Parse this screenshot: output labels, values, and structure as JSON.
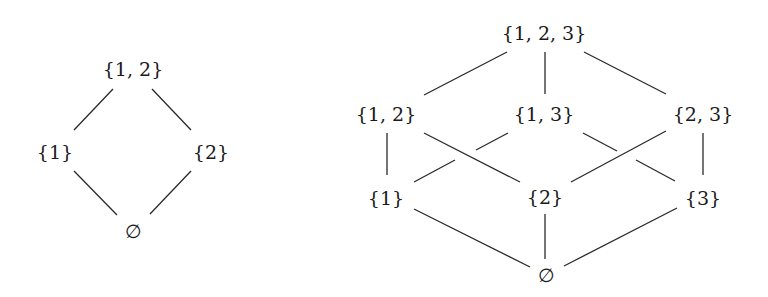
{
  "diagrams": [
    {
      "name": "hasse-diagram-powerset-2",
      "nodes": [
        {
          "id": "s12",
          "label": "{1, 2}",
          "x": 133,
          "y": 69
        },
        {
          "id": "s1",
          "label": "{1}",
          "x": 55,
          "y": 152
        },
        {
          "id": "s2",
          "label": "{2}",
          "x": 211,
          "y": 152
        },
        {
          "id": "empty",
          "label": "∅",
          "x": 133,
          "y": 231
        }
      ],
      "edges": [
        {
          "from": "s12",
          "to": "s1",
          "segments": [
            [
              113,
              89,
              74,
              130
            ]
          ]
        },
        {
          "from": "s12",
          "to": "s2",
          "segments": [
            [
              152,
              89,
              191,
              130
            ]
          ]
        },
        {
          "from": "s1",
          "to": "empty",
          "segments": [
            [
              74,
              171,
              117,
              215
            ]
          ]
        },
        {
          "from": "s2",
          "to": "empty",
          "segments": [
            [
              191,
              171,
              150,
              214
            ]
          ]
        }
      ]
    },
    {
      "name": "hasse-diagram-powerset-3",
      "nodes": [
        {
          "id": "s123",
          "label": "{1, 2, 3}",
          "x": 544,
          "y": 33
        },
        {
          "id": "s12",
          "label": "{1, 2}",
          "x": 386,
          "y": 114
        },
        {
          "id": "s13",
          "label": "{1, 3}",
          "x": 544,
          "y": 114
        },
        {
          "id": "s23",
          "label": "{2, 3}",
          "x": 703,
          "y": 114
        },
        {
          "id": "s1",
          "label": "{1}",
          "x": 386,
          "y": 198
        },
        {
          "id": "s2",
          "label": "{2}",
          "x": 545,
          "y": 197
        },
        {
          "id": "s3",
          "label": "{3}",
          "x": 703,
          "y": 198
        },
        {
          "id": "empty",
          "label": "∅",
          "x": 546,
          "y": 275
        }
      ],
      "edges": [
        {
          "from": "s123",
          "to": "s12",
          "segments": [
            [
              507,
              52,
              424,
              95
            ]
          ]
        },
        {
          "from": "s123",
          "to": "s13",
          "segments": [
            [
              545,
              52,
              545,
              94
            ]
          ]
        },
        {
          "from": "s123",
          "to": "s23",
          "segments": [
            [
              584,
              52,
              666,
              94
            ]
          ]
        },
        {
          "from": "s12",
          "to": "s1",
          "segments": [
            [
              387,
              133,
              387,
              175
            ]
          ]
        },
        {
          "from": "s12",
          "to": "s2",
          "segments": [
            [
              424,
              133,
              520,
              182
            ]
          ]
        },
        {
          "from": "s13",
          "to": "s1",
          "segments": [
            [
              508,
              133,
              476,
              150
            ],
            [
              455,
              160,
              414,
              182
            ]
          ]
        },
        {
          "from": "s13",
          "to": "s3",
          "segments": [
            [
              583,
              133,
              617,
              151
            ],
            [
              636,
              160,
              675,
              181
            ]
          ]
        },
        {
          "from": "s23",
          "to": "s2",
          "segments": [
            [
              666,
              131,
              571,
              182
            ]
          ]
        },
        {
          "from": "s23",
          "to": "s3",
          "segments": [
            [
              703,
              133,
              703,
              175
            ]
          ]
        },
        {
          "from": "s1",
          "to": "empty",
          "segments": [
            [
              414,
              209,
              530,
              267
            ]
          ]
        },
        {
          "from": "s2",
          "to": "empty",
          "segments": [
            [
              545,
              214,
              545,
              259
            ]
          ]
        },
        {
          "from": "s3",
          "to": "empty",
          "segments": [
            [
              677,
              208,
              564,
              266
            ]
          ]
        }
      ]
    }
  ],
  "colors": {
    "edge": "#2a2a2a",
    "label": "#1a1a1a",
    "background": "#ffffff"
  }
}
